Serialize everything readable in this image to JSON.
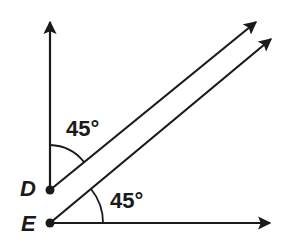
{
  "diagram": {
    "type": "geometry",
    "points": [
      {
        "name": "D",
        "label": "D",
        "x": 50,
        "y": 190
      },
      {
        "name": "E",
        "label": "E",
        "x": 50,
        "y": 223
      }
    ],
    "rays": [
      {
        "from": "D",
        "direction": "up",
        "end": [
          50,
          20
        ]
      },
      {
        "from": "D",
        "direction": "upper-right",
        "end": [
          258,
          20
        ]
      },
      {
        "from": "E",
        "direction": "upper-right",
        "end": [
          273,
          37
        ]
      },
      {
        "from": "E",
        "direction": "right",
        "end": [
          272,
          223
        ]
      }
    ],
    "angles": [
      {
        "vertex": "D",
        "label": "45°",
        "between": [
          "up",
          "upper-right"
        ]
      },
      {
        "vertex": "E",
        "label": "45°",
        "between": [
          "upper-right",
          "right"
        ]
      }
    ],
    "colors": {
      "stroke": "#1a1a1a",
      "background": "#ffffff"
    }
  }
}
